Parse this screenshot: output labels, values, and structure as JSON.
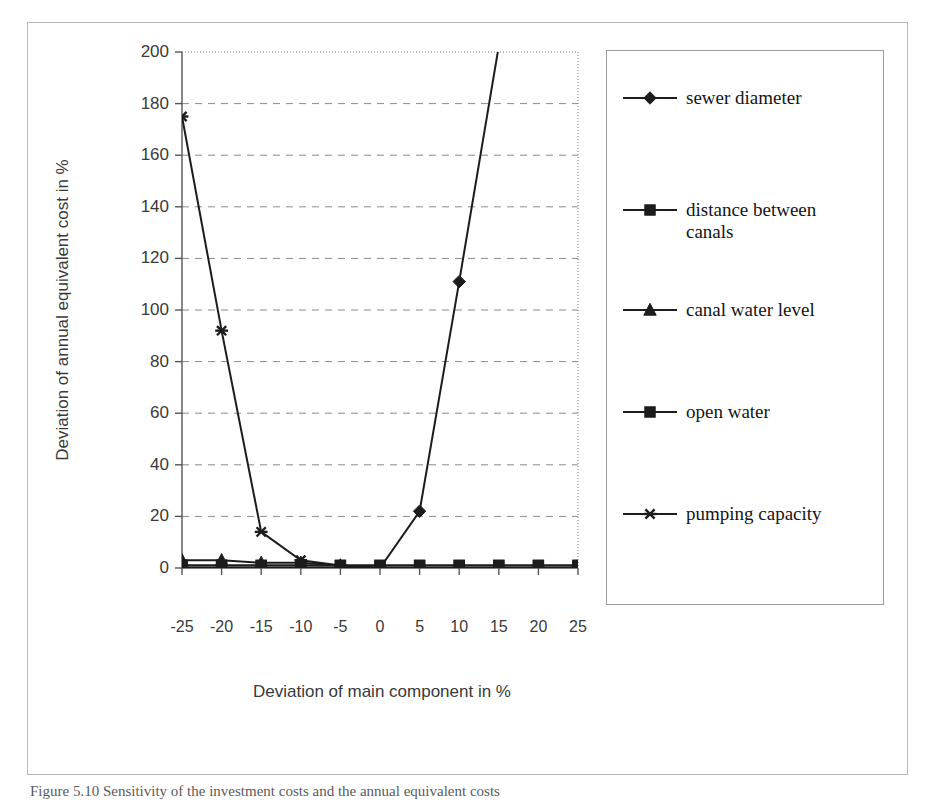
{
  "chart_data": {
    "type": "line",
    "title": "",
    "xlabel": "Deviation of main component in %",
    "ylabel": "Deviation of annual equivalent cost in %",
    "x": [
      -25,
      -20,
      -15,
      -10,
      -5,
      0,
      5,
      10,
      15,
      20,
      25
    ],
    "xtick_labels": [
      "-25",
      "-20",
      "-15",
      "-10",
      "-5",
      "0",
      "5",
      "10",
      "15",
      "20",
      "25"
    ],
    "ytick_labels": [
      "0",
      "20",
      "40",
      "60",
      "80",
      "100",
      "120",
      "140",
      "160",
      "180",
      "200"
    ],
    "ylim": [
      0,
      200
    ],
    "ytick_step": 20,
    "grid": "horizontal-dashed",
    "legend_position": "right",
    "series": [
      {
        "name": "sewer diameter",
        "marker": "diamond",
        "values": [
          0,
          0,
          0,
          0,
          0,
          0,
          22,
          111,
          null,
          null,
          null
        ],
        "clipped_above": true,
        "note": "rises off the top of the axis between 10% and 15%"
      },
      {
        "name": "distance between canals",
        "marker": "square",
        "values": [
          1,
          1,
          1,
          1,
          1,
          1,
          1,
          1,
          1,
          1,
          1
        ]
      },
      {
        "name": "canal water level",
        "marker": "triangle",
        "values": [
          3,
          3,
          2,
          2,
          1,
          0,
          0,
          0,
          0,
          0,
          0
        ]
      },
      {
        "name": "open water",
        "marker": "square",
        "values": [
          1,
          1,
          1,
          1,
          1,
          1,
          1,
          1,
          1,
          1,
          1
        ]
      },
      {
        "name": "pumping capacity",
        "marker": "asterisk",
        "values": [
          175,
          92,
          14,
          3,
          1,
          0,
          0,
          0,
          0,
          0,
          0
        ]
      }
    ]
  },
  "legend": {
    "entries": [
      {
        "label": "sewer diameter",
        "marker": "diamond-marker-icon"
      },
      {
        "label": "distance between\ncanals",
        "marker": "square-marker-icon"
      },
      {
        "label": "canal water level",
        "marker": "triangle-marker-icon"
      },
      {
        "label": "open water",
        "marker": "square-marker-icon"
      },
      {
        "label": "pumping capacity",
        "marker": "asterisk-marker-icon"
      }
    ]
  },
  "axes": {
    "y_title": "Deviation of annual equivalent cost in %",
    "x_title": "Deviation of main component in %",
    "y_ticks": [
      "200",
      "180",
      "160",
      "140",
      "120",
      "100",
      "80",
      "60",
      "40",
      "20",
      "0"
    ],
    "x_ticks": [
      "-25",
      "-20",
      "-15",
      "-10",
      "-5",
      "0",
      "5",
      "10",
      "15",
      "20",
      "25"
    ]
  },
  "caption": {
    "text": "Figure 5.10 Sensitivity of the investment costs and the annual equivalent costs"
  },
  "colors": {
    "ink": "#1c1c1c",
    "axis": "#555555",
    "grid": "#8a8a8a",
    "frame": "#b9b9b9",
    "legend_border": "#9c9c9c",
    "background": "#ffffff"
  }
}
